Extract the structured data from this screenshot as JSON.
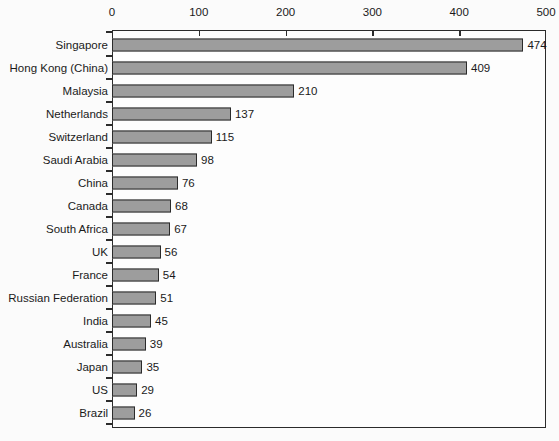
{
  "chart_data": {
    "type": "bar",
    "orientation": "horizontal",
    "title": "",
    "subtitle": "",
    "xlabel": "",
    "ylabel": "",
    "xlim": [
      0,
      500
    ],
    "xticks": [
      0,
      100,
      200,
      300,
      400,
      500
    ],
    "xtick_labels": [
      "0",
      "100",
      "200",
      "300",
      "400",
      "500"
    ],
    "grid": false,
    "legend": null,
    "axis_position": "top",
    "categories": [
      "Singapore",
      "Hong Kong (China)",
      "Malaysia",
      "Netherlands",
      "Switzerland",
      "Saudi Arabia",
      "China",
      "Canada",
      "South Africa",
      "UK",
      "France",
      "Russian Federation",
      "India",
      "Australia",
      "Japan",
      "US",
      "Brazil"
    ],
    "values": [
      474,
      409,
      210,
      137,
      115,
      98,
      76,
      68,
      67,
      56,
      54,
      51,
      45,
      39,
      35,
      29,
      26
    ],
    "value_labels": [
      "474",
      "409",
      "210",
      "137",
      "115",
      "98",
      "76",
      "68",
      "67",
      "56",
      "54",
      "51",
      "45",
      "39",
      "35",
      "29",
      "26"
    ],
    "colors": {
      "bar_fill": "#9d9d9d",
      "bar_border": "#2b2b2b",
      "axis": "#2b2b2b",
      "text": "#1a1a1a",
      "background": "#fbfbfb",
      "plot_background": "#fdfdfd"
    }
  }
}
